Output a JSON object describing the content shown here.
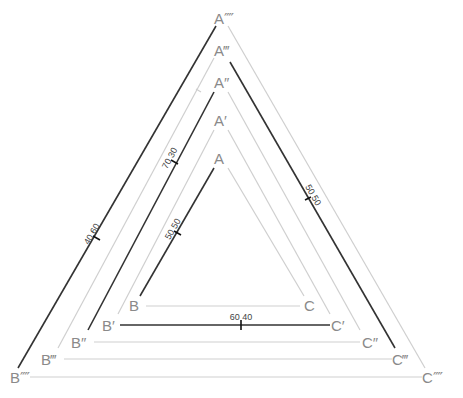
{
  "diagram": {
    "colors": {
      "light_line": "#cfcfcf",
      "dark_line": "#333333",
      "label": "#8a8a8a"
    },
    "triangles": [
      {
        "apex": "A",
        "left": "B",
        "right": "C",
        "dark_side": "AB",
        "tick_label": "50 50"
      },
      {
        "apex": "A′",
        "left": "B′",
        "right": "C′",
        "dark_side": "B′C′",
        "tick_label": "60 40"
      },
      {
        "apex": "A″",
        "left": "B″",
        "right": "C″",
        "dark_side": "A″B″",
        "tick_label": "70 30"
      },
      {
        "apex": "A‴",
        "left": "B‴",
        "right": "C‴",
        "dark_side": "A‴C‴",
        "tick_label": "50 50"
      },
      {
        "apex": "A⁗",
        "left": "B⁗",
        "right": "C⁗",
        "dark_side": "A⁗B⁗",
        "tick_label": "40 60"
      }
    ]
  }
}
